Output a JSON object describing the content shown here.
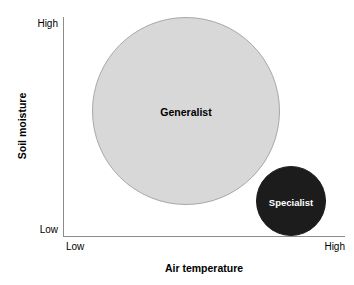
{
  "chart_data": {
    "type": "scatter",
    "title": "",
    "xlabel": "Air temperature",
    "ylabel": "Soil moisture",
    "x_tick_labels": [
      "Low",
      "High"
    ],
    "y_tick_labels": [
      "Low",
      "High"
    ],
    "xlim": [
      "Low",
      "High"
    ],
    "ylim": [
      "Low",
      "High"
    ],
    "grid": false,
    "legend": "none",
    "series": [
      {
        "name": "Generalist",
        "label": "Generalist",
        "x": 0.44,
        "y": 0.6,
        "radius": 0.43,
        "color": "#d8d8d8",
        "outline_color": "#a8a8a8",
        "label_color": "#000000"
      },
      {
        "name": "Specialist",
        "label": "Specialist",
        "x": 0.81,
        "y": 0.16,
        "radius": 0.16,
        "color": "#1c1c1c",
        "outline_color": "#1c1c1c",
        "label_color": "#ffffff"
      }
    ]
  },
  "axes": {
    "y": {
      "title": "Soil moisture",
      "high_label": "High",
      "low_label": "Low",
      "line_color": "#8c8c8c"
    },
    "x": {
      "title": "Air temperature",
      "high_label": "High",
      "low_label": "Low",
      "line_color": "#8c8c8c"
    }
  },
  "bubbles": {
    "generalist": {
      "label": "Generalist"
    },
    "specialist": {
      "label": "Specialist"
    }
  },
  "colors": {
    "background": "#ffffff",
    "generalist_fill": "#d8d8d8",
    "generalist_stroke": "#a8a8a8",
    "specialist_fill": "#1c1c1c",
    "axis": "#8c8c8c",
    "text": "#000000"
  }
}
